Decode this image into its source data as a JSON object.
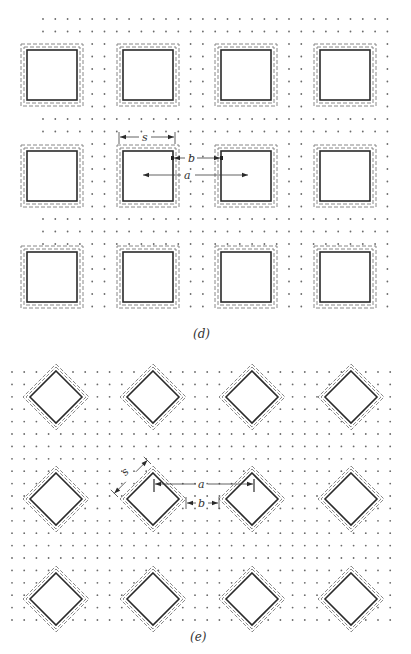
{
  "figures": [
    {
      "id": "d",
      "caption": "(d)",
      "caption_pos": [
        193,
        327
      ],
      "shape": "square",
      "grid": {
        "x0": 43,
        "y0": 19,
        "dx": 12.3,
        "dy": 12.5,
        "cols": 29,
        "rows": 24
      },
      "cells": {
        "cols_x": [
          21,
          117,
          215,
          314
        ],
        "rows_y": [
          44,
          145,
          246
        ],
        "outer_size": 62,
        "inset_dash2": 3,
        "inset_solid": 6
      },
      "annotations": {
        "s_label": "s",
        "b_label": "b",
        "a_label": "a"
      }
    },
    {
      "id": "e",
      "caption": "(e)",
      "caption_pos": [
        190,
        630
      ],
      "shape": "diamond",
      "grid": {
        "x0": 12,
        "y0": 372,
        "dx": 12.2,
        "dy": 12.4,
        "cols": 33,
        "rows": 21
      },
      "cells": {
        "cols_cx": [
          56,
          153,
          252,
          351
        ],
        "rows_cy": [
          397,
          499,
          599
        ],
        "outer_half": 33,
        "mid_half": 30,
        "inner_half": 26
      },
      "annotations": {
        "s_label": "s",
        "a_label": "a",
        "b_label": "b"
      }
    }
  ]
}
